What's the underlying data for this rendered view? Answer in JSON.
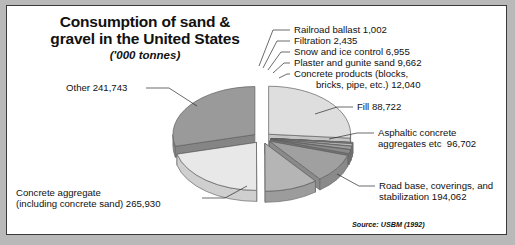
{
  "figure": {
    "title_line1": "Consumption of sand &",
    "title_line2": "gravel in the United States",
    "units": "('000 tonnes)",
    "source": "Source: USBM (1992)",
    "border_color": "#3a3a3a",
    "background": "#ffffff",
    "page_background": "#b9b9b9"
  },
  "labels": {
    "other": "Other 241,743",
    "concrete_aggregate_l1": "Concrete aggregate",
    "concrete_aggregate_l2": "(including concrete sand) 265,930",
    "railroad": "Railroad ballast 1,002",
    "filtration": "Filtration 2,435",
    "snow_ice": "Snow and ice control 6,955",
    "plaster": "Plaster and gunite sand 9,662",
    "concrete_products_l1": "Concrete products (blocks,",
    "concrete_products_l2": "bricks, pipe, etc.) 12,040",
    "fill": "Fill 88,722",
    "asphaltic_l1": "Asphaltic concrete",
    "asphaltic_l2": "aggregates etc  96,702",
    "roadbase_l1": "Road base, coverings, and",
    "roadbase_l2": "stabilization 194,062"
  },
  "chart_data": {
    "type": "pie",
    "title": "Consumption of sand & gravel in the United States",
    "subtitle": "('000 tonnes)",
    "units": "'000 tonnes",
    "source": "USBM (1992)",
    "style": "exploded 3D pie",
    "legend": "none (direct labels with leader lines)",
    "grid": false,
    "total": 817511,
    "categories": [
      "Other",
      "Railroad ballast",
      "Filtration",
      "Snow and ice control",
      "Plaster and gunite sand",
      "Concrete products (blocks, bricks, pipe, etc.)",
      "Fill",
      "Asphaltic concrete aggregates etc",
      "Road base, coverings, and stabilization",
      "Concrete aggregate (including concrete sand)"
    ],
    "values": [
      241743,
      1002,
      2435,
      6955,
      9662,
      12040,
      88722,
      96702,
      194062,
      265930
    ],
    "slices": [
      {
        "label": "Other",
        "value": 241743,
        "color": "#dedede",
        "side_color": "#c4c4c4"
      },
      {
        "label": "Railroad ballast",
        "value": 1002,
        "color": "#f2f2f2",
        "side_color": "#d8d8d8"
      },
      {
        "label": "Filtration",
        "value": 2435,
        "color": "#d2d2d2",
        "side_color": "#bdbdbd"
      },
      {
        "label": "Snow and ice control",
        "value": 6955,
        "color": "#bcbcbc",
        "side_color": "#a6a6a6"
      },
      {
        "label": "Plaster and gunite sand",
        "value": 9662,
        "color": "#9e9e9e",
        "side_color": "#8a8a8a"
      },
      {
        "label": "Concrete products (blocks, bricks, pipe, etc.)",
        "value": 12040,
        "color": "#8a8a8a",
        "side_color": "#747474"
      },
      {
        "label": "Fill",
        "value": 88722,
        "color": "#a0a0a0",
        "side_color": "#8a8a8a"
      },
      {
        "label": "Asphaltic concrete aggregates etc",
        "value": 96702,
        "color": "#b5b5b5",
        "side_color": "#9c9c9c"
      },
      {
        "label": "Road base, coverings, and stabilization",
        "value": 194062,
        "color": "#e8e8e8",
        "side_color": "#cfcfcf"
      },
      {
        "label": "Concrete aggregate (including concrete sand)",
        "value": 265930,
        "color": "#9a9a9a",
        "side_color": "#858585"
      }
    ]
  }
}
